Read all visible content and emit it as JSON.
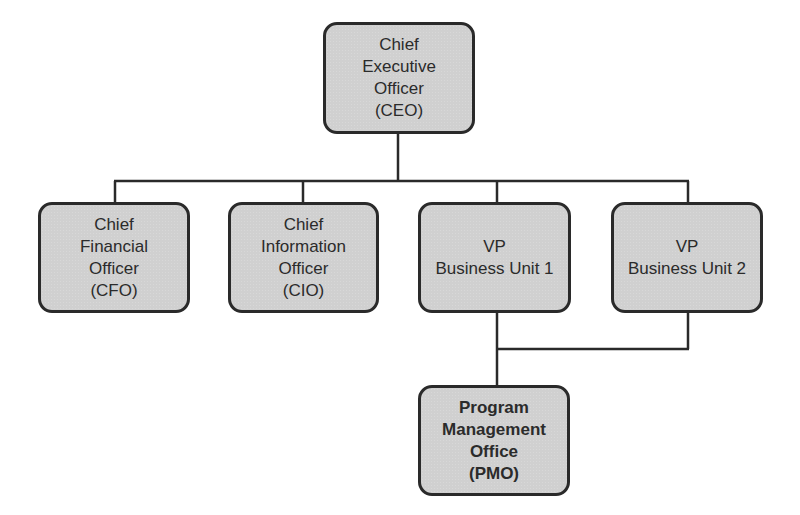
{
  "diagram": {
    "type": "org-chart",
    "colors": {
      "box_fill": "#d0d0d0",
      "box_border": "#2a2a2a",
      "line": "#2a2a2a",
      "text": "#2b2b2b",
      "background": "#ffffff"
    },
    "nodes": {
      "ceo": {
        "lines": [
          "Chief",
          "Executive",
          "Officer",
          "(CEO)"
        ]
      },
      "cfo": {
        "lines": [
          "Chief",
          "Financial",
          "Officer",
          "(CFO)"
        ]
      },
      "cio": {
        "lines": [
          "Chief",
          "Information",
          "Officer",
          "(CIO)"
        ]
      },
      "vp1": {
        "lines": [
          "VP",
          "Business Unit 1"
        ]
      },
      "vp2": {
        "lines": [
          "VP",
          "Business Unit 2"
        ]
      },
      "pmo": {
        "lines": [
          "Program",
          "Management",
          "Office",
          "(PMO)"
        ]
      }
    },
    "edges": [
      {
        "from": "ceo",
        "to": "cfo"
      },
      {
        "from": "ceo",
        "to": "cio"
      },
      {
        "from": "ceo",
        "to": "vp1"
      },
      {
        "from": "ceo",
        "to": "vp2"
      },
      {
        "from": "vp1",
        "to": "pmo"
      },
      {
        "from": "vp2",
        "to": "pmo"
      }
    ]
  }
}
